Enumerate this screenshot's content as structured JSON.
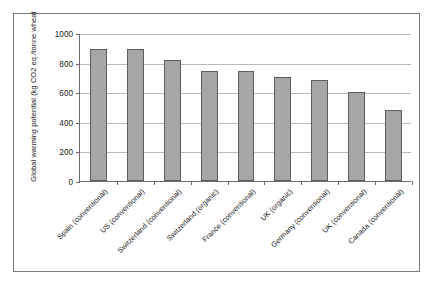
{
  "chart_data": {
    "type": "bar",
    "title": "",
    "subtitle": "",
    "xlabel": "",
    "ylabel": "Global warming potential (kg CO2 eq./tonne wheat",
    "ylim": [
      0,
      1000
    ],
    "ytick_values": [
      0,
      200,
      400,
      600,
      800,
      1000
    ],
    "ytick_labels": [
      "0",
      "200",
      "400",
      "600",
      "800",
      "1000"
    ],
    "grid": true,
    "legend": false,
    "bar_color": "#a6a6a6",
    "bar_border_color": "#5e5e5e",
    "gridline_color": "#b9b9b9",
    "axis_color": "#6b6b6b",
    "categories": [
      "Spain (conventional)",
      "US (conventional)",
      "Switzerland (conventional)",
      "Switzerland (organic)",
      "France (conventional)",
      "UK (organic)",
      "Germany (conventional)",
      "UK (conventional)",
      "Canada (conventional)"
    ],
    "values": [
      890,
      890,
      820,
      745,
      740,
      705,
      680,
      600,
      477
    ]
  }
}
